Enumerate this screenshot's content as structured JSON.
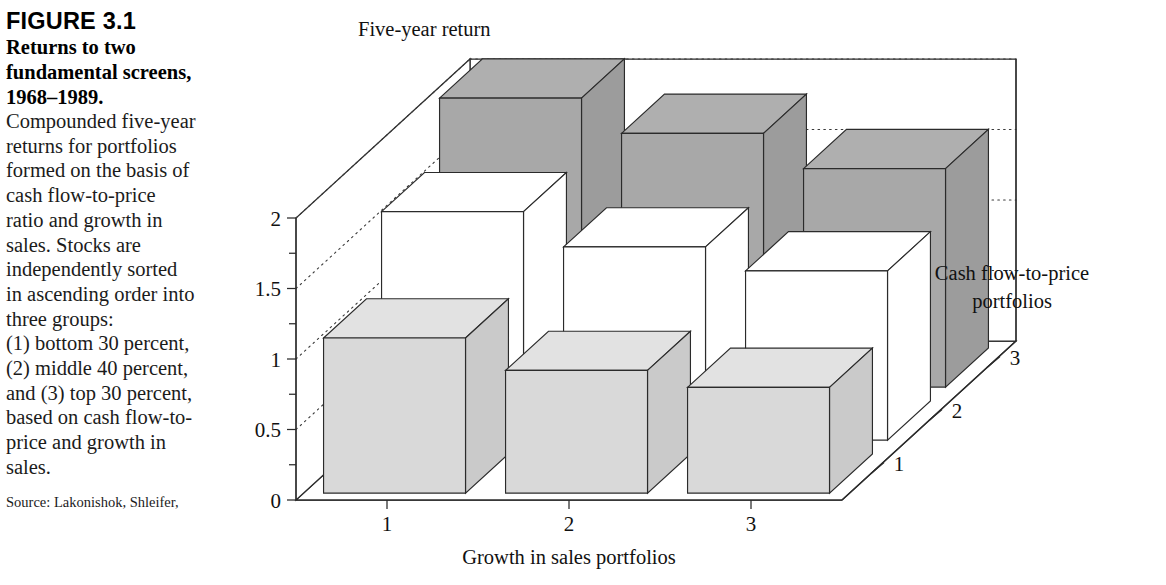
{
  "caption": {
    "figure_number": "FIGURE 3.1",
    "title_lines": [
      "Returns to two",
      "fundamental screens,",
      "1968–1989."
    ],
    "body_lines": [
      "Compounded five-year",
      "returns for portfolios",
      "formed on the basis of",
      "cash flow-to-price",
      "ratio and growth in",
      "sales. Stocks are",
      "independently sorted",
      "in ascending order into",
      "three groups:",
      "(1) bottom 30 percent,",
      "(2) middle 40 percent,",
      "and (3) top 30 percent,",
      "based on cash flow-to-",
      "price and growth in",
      "sales."
    ],
    "source": "Source: Lakonishok, Shleifer,"
  },
  "chart_data": {
    "type": "bar",
    "title": "",
    "ylabel": "Five-year return",
    "xlabel": "Growth in sales portfolios",
    "zlabel": "Cash flow-to-price\nportfolios",
    "zlabel_lines": [
      "Cash flow-to-price",
      "portfolios"
    ],
    "categories": [
      "1",
      "2",
      "3"
    ],
    "depth_categories": [
      "1",
      "2",
      "3"
    ],
    "ylim": [
      0,
      2
    ],
    "ytick_labels": [
      "0",
      "0.5",
      "1",
      "1.5",
      "2"
    ],
    "ytick_values": [
      0,
      0.5,
      1,
      1.5,
      2
    ],
    "yminor_values": [
      0.25,
      0.75,
      1.25,
      1.75
    ],
    "grid": "dotted-backwall",
    "legend_position": "none",
    "series": [
      {
        "name": "1",
        "depth_index": 0,
        "color": "#d9d9d9",
        "values": [
          1.1,
          0.87,
          0.75
        ]
      },
      {
        "name": "2",
        "depth_index": 1,
        "color": "#ffffff",
        "values": [
          1.62,
          1.37,
          1.2
        ]
      },
      {
        "name": "3",
        "depth_index": 2,
        "color": "#a8a8a8",
        "values": [
          2.05,
          1.8,
          1.55
        ]
      }
    ]
  },
  "colors": {
    "front_row": "#d9d9d9",
    "middle_row": "#ffffff",
    "back_row": "#a8a8a8",
    "outline": "#2b2b2b"
  }
}
